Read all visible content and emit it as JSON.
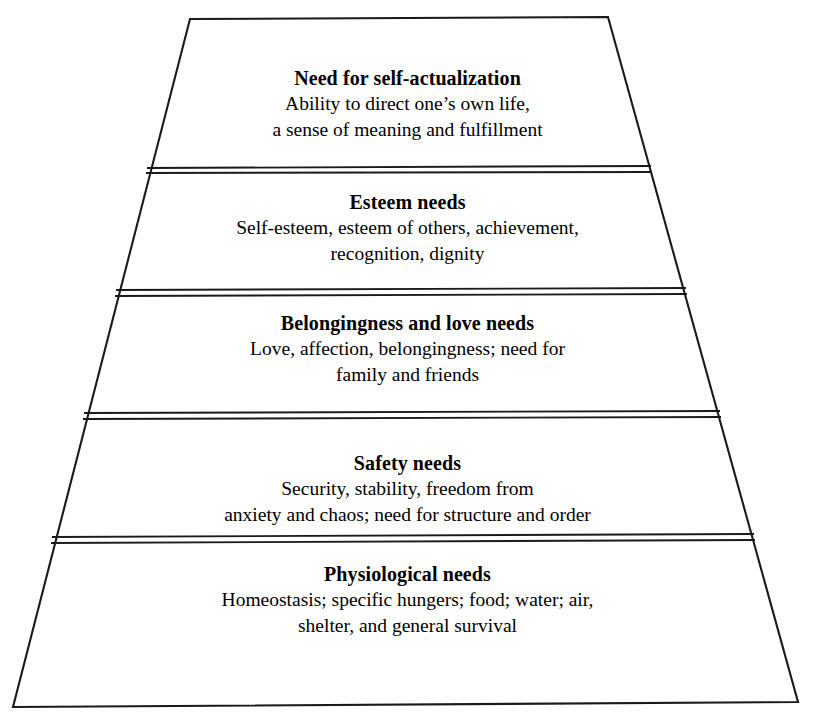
{
  "figure": {
    "name": "maslow-hierarchy-of-needs-pyramid",
    "shape": "truncated-pyramid",
    "background_color": "#ffffff",
    "line_color": "#1a1a1a",
    "geometry": {
      "width": 815,
      "height": 728,
      "apex_top_y": 18,
      "apex_left_x": 190,
      "apex_right_x": 608,
      "base_y": 705,
      "base_left_x": 13,
      "base_right_x": 798,
      "divider_y": [
        170,
        292,
        415,
        539
      ],
      "divider_gap": 5
    }
  },
  "tiers": [
    {
      "id": "self-actualization",
      "level": 5,
      "title": "Need for self-actualization",
      "desc_lines": [
        "Ability to direct one’s own life,",
        "a sense of meaning and fulfillment"
      ]
    },
    {
      "id": "esteem",
      "level": 4,
      "title": "Esteem needs",
      "desc_lines": [
        "Self-esteem, esteem of others, achievement,",
        "recognition, dignity"
      ]
    },
    {
      "id": "belonging",
      "level": 3,
      "title": "Belongingness and love needs",
      "desc_lines": [
        "Love, affection, belongingness; need for",
        "family and friends"
      ]
    },
    {
      "id": "safety",
      "level": 2,
      "title": "Safety needs",
      "desc_lines": [
        "Security, stability, freedom from",
        "anxiety and chaos; need for structure and order"
      ]
    },
    {
      "id": "physiological",
      "level": 1,
      "title": "Physiological needs",
      "desc_lines": [
        "Homeostasis; specific hungers; food; water; air,",
        "shelter, and general survival"
      ]
    }
  ]
}
